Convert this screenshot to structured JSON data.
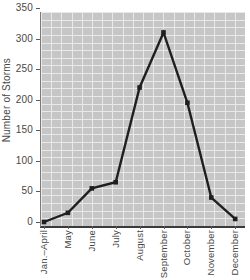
{
  "chart_data": {
    "type": "line",
    "title": "",
    "xlabel": "",
    "ylabel": "Number of Storms",
    "categories": [
      "Jan.–April",
      "May",
      "June",
      "July",
      "August",
      "September",
      "October",
      "November",
      "December"
    ],
    "values": [
      0,
      15,
      55,
      65,
      220,
      310,
      195,
      40,
      5
    ],
    "ylim": [
      0,
      350
    ],
    "yticks": [
      0,
      50,
      100,
      150,
      200,
      250,
      300,
      350
    ],
    "grid": true,
    "legend_position": "none",
    "colors": {
      "line": "#1f1f1f",
      "marker": "#1f1f1f",
      "plot_background": "#c6c6c6",
      "grid_line": "#e9e9e9",
      "axis": "#3a3a3a",
      "text": "#474747"
    }
  }
}
